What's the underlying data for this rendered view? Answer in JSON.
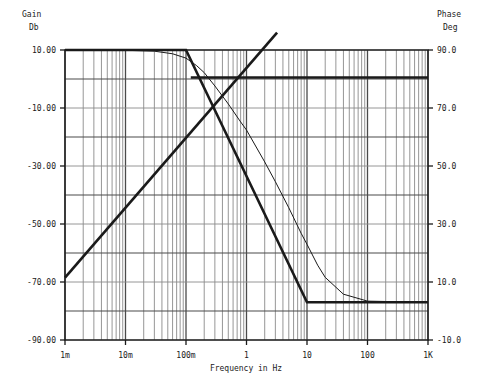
{
  "figure": {
    "background": "#ffffff",
    "ink": "#1a1a1a",
    "grid_major_color": "#4a4a4a",
    "grid_minor_color": "#8a8a8a"
  },
  "left_axis": {
    "name": "Gain",
    "unit": "Db",
    "ticks": [
      "10.00",
      "-10.00",
      "-30.00",
      "-50.00",
      "-70.00",
      "-90.00"
    ]
  },
  "right_axis": {
    "name": "Phase",
    "unit": "Deg",
    "ticks": [
      "90.0",
      "70.0",
      "50.0",
      "30.0",
      "10.0",
      "-10.0"
    ]
  },
  "x_axis": {
    "title": "Frequency in Hz",
    "ticks": [
      "1m",
      "10m",
      "100m",
      "1",
      "10",
      "100",
      "1K"
    ]
  },
  "chart_data": {
    "type": "line",
    "title": "",
    "xlabel": "Frequency in Hz",
    "ylabel": "Gain Db",
    "y2label": "Phase Deg",
    "xscale": "log",
    "xlim": [
      0.001,
      1000
    ],
    "ylim": [
      -90,
      10
    ],
    "y2lim": [
      -10,
      90
    ],
    "grid": true,
    "legend": "none",
    "xtick_labels": [
      "1m",
      "10m",
      "100m",
      "1",
      "10",
      "100",
      "1K"
    ],
    "xtick_values": [
      0.001,
      0.01,
      0.1,
      1,
      10,
      100,
      1000
    ],
    "ytick_values": [
      10,
      -10,
      -30,
      -50,
      -70,
      -90
    ],
    "ytick_labels": [
      "10.00",
      "-10.00",
      "-30.00",
      "-50.00",
      "-70.00",
      "-90.00"
    ],
    "y2tick_values": [
      90,
      70,
      50,
      30,
      10,
      -10
    ],
    "y2tick_labels": [
      "90.0",
      "70.0",
      "50.0",
      "30.0",
      "10.0",
      "-10.0"
    ],
    "series": [
      {
        "name": "gain-asymptote",
        "axis": "left",
        "style": "thick",
        "x": [
          0.001,
          0.1,
          10,
          1000
        ],
        "y": [
          10,
          10,
          -77,
          -77
        ]
      },
      {
        "name": "gain-actual",
        "axis": "left",
        "style": "thin",
        "x": [
          0.001,
          0.01,
          0.03,
          0.06,
          0.1,
          0.15,
          0.2,
          0.3,
          0.5,
          0.8,
          1,
          2,
          3,
          5,
          8,
          10,
          15,
          20,
          40,
          100,
          1000
        ],
        "y": [
          10,
          9.9,
          9.6,
          8.7,
          7.2,
          4.6,
          2.2,
          -2.4,
          -8.6,
          -14.8,
          -17.6,
          -28.6,
          -35.4,
          -44.4,
          -53.2,
          -57.0,
          -64.2,
          -68.4,
          -74.2,
          -76.6,
          -77
        ]
      },
      {
        "name": "phase-rising",
        "axis": "left",
        "style": "thick",
        "x": [
          0.001,
          3.2
        ],
        "y": [
          -68.5,
          16
        ]
      },
      {
        "name": "phase-flat",
        "axis": "left",
        "style": "thick",
        "x": [
          0.12,
          1000
        ],
        "y": [
          0.5,
          0.5
        ]
      }
    ]
  }
}
